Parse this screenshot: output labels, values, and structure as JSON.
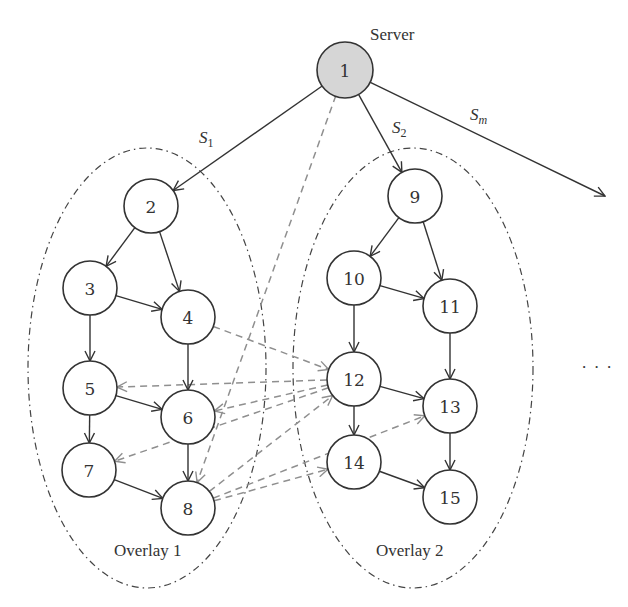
{
  "diagram": {
    "type": "overlay-network",
    "server_label": "Server",
    "streams": [
      {
        "id": "s1",
        "label": "S",
        "sub": "1"
      },
      {
        "id": "s2",
        "label": "S",
        "sub": "2"
      },
      {
        "id": "sm",
        "label": "S",
        "sub": "m"
      }
    ],
    "overlays": [
      {
        "id": "overlay1",
        "label": "Overlay 1",
        "cx": 147,
        "cy": 368,
        "rx": 119,
        "ry": 220
      },
      {
        "id": "overlay2",
        "label": "Overlay 2",
        "cx": 413,
        "cy": 368,
        "rx": 120,
        "ry": 220
      }
    ],
    "ellipsis": ". . .",
    "colors": {
      "server_fill": "#d6d6d6",
      "node_fill": "#ffffff",
      "stroke": "#333333",
      "cross_link": "#8f8f8f"
    },
    "nodes": [
      {
        "id": "1",
        "label": "1",
        "x": 345,
        "y": 70,
        "server": true
      },
      {
        "id": "2",
        "label": "2",
        "x": 151,
        "y": 206
      },
      {
        "id": "3",
        "label": "3",
        "x": 90,
        "y": 288
      },
      {
        "id": "4",
        "label": "4",
        "x": 188,
        "y": 317
      },
      {
        "id": "5",
        "label": "5",
        "x": 90,
        "y": 388
      },
      {
        "id": "6",
        "label": "6",
        "x": 188,
        "y": 417
      },
      {
        "id": "7",
        "label": "7",
        "x": 89,
        "y": 470
      },
      {
        "id": "8",
        "label": "8",
        "x": 188,
        "y": 508
      },
      {
        "id": "9",
        "label": "9",
        "x": 415,
        "y": 196
      },
      {
        "id": "10",
        "label": "10",
        "x": 354,
        "y": 278
      },
      {
        "id": "11",
        "label": "11",
        "x": 450,
        "y": 306
      },
      {
        "id": "12",
        "label": "12",
        "x": 354,
        "y": 379
      },
      {
        "id": "13",
        "label": "13",
        "x": 450,
        "y": 406
      },
      {
        "id": "14",
        "label": "14",
        "x": 354,
        "y": 462
      },
      {
        "id": "15",
        "label": "15",
        "x": 450,
        "y": 497
      }
    ],
    "edges": [
      {
        "from": "1",
        "to": "2",
        "style": "solid",
        "label": "S1"
      },
      {
        "from": "1",
        "to": "9",
        "style": "solid",
        "label": "S2"
      },
      {
        "from": "1",
        "to": "out",
        "style": "solid",
        "label": "Sm"
      },
      {
        "from": "2",
        "to": "3",
        "style": "solid"
      },
      {
        "from": "2",
        "to": "4",
        "style": "solid"
      },
      {
        "from": "3",
        "to": "4",
        "style": "solid"
      },
      {
        "from": "3",
        "to": "5",
        "style": "solid"
      },
      {
        "from": "4",
        "to": "6",
        "style": "solid"
      },
      {
        "from": "5",
        "to": "6",
        "style": "solid"
      },
      {
        "from": "5",
        "to": "7",
        "style": "solid"
      },
      {
        "from": "6",
        "to": "8",
        "style": "solid"
      },
      {
        "from": "7",
        "to": "8",
        "style": "solid"
      },
      {
        "from": "9",
        "to": "10",
        "style": "solid"
      },
      {
        "from": "9",
        "to": "11",
        "style": "solid"
      },
      {
        "from": "10",
        "to": "11",
        "style": "solid"
      },
      {
        "from": "10",
        "to": "12",
        "style": "solid"
      },
      {
        "from": "11",
        "to": "13",
        "style": "solid"
      },
      {
        "from": "12",
        "to": "13",
        "style": "solid"
      },
      {
        "from": "12",
        "to": "14",
        "style": "solid"
      },
      {
        "from": "13",
        "to": "15",
        "style": "solid"
      },
      {
        "from": "14",
        "to": "15",
        "style": "solid"
      },
      {
        "from": "1",
        "to": "8",
        "style": "dashed"
      },
      {
        "from": "4",
        "to": "12",
        "style": "dashed"
      },
      {
        "from": "12",
        "to": "5",
        "style": "dashed"
      },
      {
        "from": "12",
        "to": "6",
        "style": "dashed"
      },
      {
        "from": "12",
        "to": "7",
        "style": "dashed"
      },
      {
        "from": "8",
        "to": "12",
        "style": "dashed"
      },
      {
        "from": "8",
        "to": "13",
        "style": "dashed"
      },
      {
        "from": "8",
        "to": "14",
        "style": "dashed"
      }
    ]
  }
}
